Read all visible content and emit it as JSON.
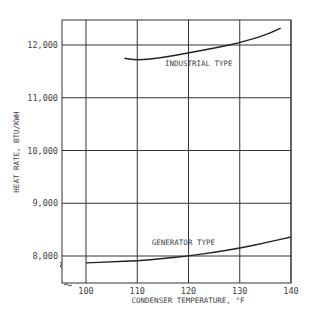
{
  "chart_data": {
    "type": "line",
    "title": "",
    "xlabel": "CONDENSER TEMPERATURE, °F",
    "ylabel": "HEAT RATE, BTU/KWH",
    "xlim": [
      95,
      140
    ],
    "ylim": [
      7500,
      12500
    ],
    "grid": true,
    "legend": "none (inline curve labels)",
    "x_ticks": [
      100,
      110,
      120,
      130,
      140
    ],
    "x_tick_labels": [
      "100",
      "110",
      "120",
      "130",
      "140"
    ],
    "y_ticks": [
      8000,
      9000,
      10000,
      11000,
      12000
    ],
    "y_tick_labels": [
      "8,000",
      "9,000",
      "10,000",
      "11,000",
      "12,000"
    ],
    "axis_break": "y-axis broken below 8,000 (zigzag mark)",
    "series": [
      {
        "name": "INDUSTRIAL TYPE",
        "x": [
          107.5,
          110,
          115,
          120,
          125,
          130,
          135,
          138
        ],
        "y": [
          11750,
          11710,
          11760,
          11850,
          11940,
          12040,
          12190,
          12320
        ]
      },
      {
        "name": "GENERATOR TYPE",
        "x": [
          100,
          105,
          110,
          115,
          120,
          125,
          130,
          135,
          140
        ],
        "y": [
          7870,
          7890,
          7910,
          7950,
          8000,
          8070,
          8150,
          8250,
          8360
        ]
      }
    ],
    "annotations": [
      {
        "text": "INDUSTRIAL TYPE",
        "x": 122,
        "y": 11600
      },
      {
        "text": "GENERATOR TYPE",
        "x": 119,
        "y": 8200
      }
    ]
  }
}
